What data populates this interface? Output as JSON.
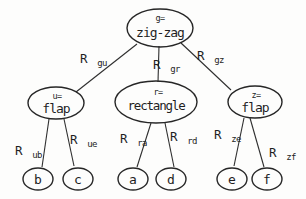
{
  "colors": {
    "ink": "#262626",
    "background": "#fdfdfc"
  },
  "tree": {
    "root": {
      "var_label": "g=",
      "value": "zig-zag"
    },
    "children": [
      {
        "id": "u",
        "var_label": "u=",
        "value": "flap",
        "edge_from_root": {
          "base": "R",
          "sub": "gu"
        },
        "leaves": [
          {
            "value": "b",
            "edge": {
              "base": "R",
              "sub": "ub"
            }
          },
          {
            "value": "c",
            "edge": {
              "base": "R",
              "sub": "ue"
            }
          }
        ]
      },
      {
        "id": "r",
        "var_label": "r=",
        "value": "rectangle",
        "edge_from_root": {
          "base": "R",
          "sub": "gr"
        },
        "leaves": [
          {
            "value": "a",
            "edge": {
              "base": "R",
              "sub": "ra"
            }
          },
          {
            "value": "d",
            "edge": {
              "base": "R",
              "sub": "rd"
            }
          }
        ]
      },
      {
        "id": "z",
        "var_label": "z=",
        "value": "flap",
        "edge_from_root": {
          "base": "R",
          "sub": "gz"
        },
        "leaves": [
          {
            "value": "e",
            "edge": {
              "base": "R",
              "sub": "ze"
            }
          },
          {
            "value": "f",
            "edge": {
              "base": "R",
              "sub": "zf"
            }
          }
        ]
      }
    ]
  }
}
